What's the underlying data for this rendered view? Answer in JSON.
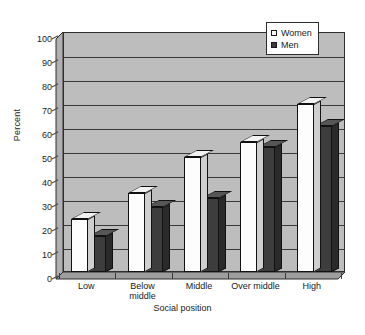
{
  "chart_data": {
    "type": "bar",
    "title": "",
    "xlabel": "Social position",
    "ylabel": "Percent",
    "categories": [
      "Low",
      "Below\nmiddle",
      "Middle",
      "Over middle",
      "High"
    ],
    "series": [
      {
        "name": "Women",
        "values": [
          22,
          33,
          48,
          54,
          70
        ],
        "color": "#fdfdfd"
      },
      {
        "name": "Men",
        "values": [
          15,
          27,
          31,
          52,
          61
        ],
        "color": "#3d3d3d"
      }
    ],
    "ylim": [
      0,
      100
    ],
    "y_ticks": [
      0,
      10,
      20,
      30,
      40,
      50,
      60,
      70,
      80,
      90,
      100
    ],
    "y_tick_labels": [
      "0",
      "10",
      "20",
      "30",
      "40",
      "50",
      "60",
      "70",
      "80",
      "90",
      "100"
    ],
    "grid": true,
    "legend_position": "top-right",
    "plot_background": "#bdbdbd",
    "axis_color": "#2e2e2e"
  },
  "legend": {
    "items": [
      {
        "label": "Women",
        "swatch": "#fdfdfd"
      },
      {
        "label": "Men",
        "swatch": "#3d3d3d"
      }
    ]
  },
  "axes": {
    "y_title": "Percent",
    "x_title": "Social position"
  }
}
